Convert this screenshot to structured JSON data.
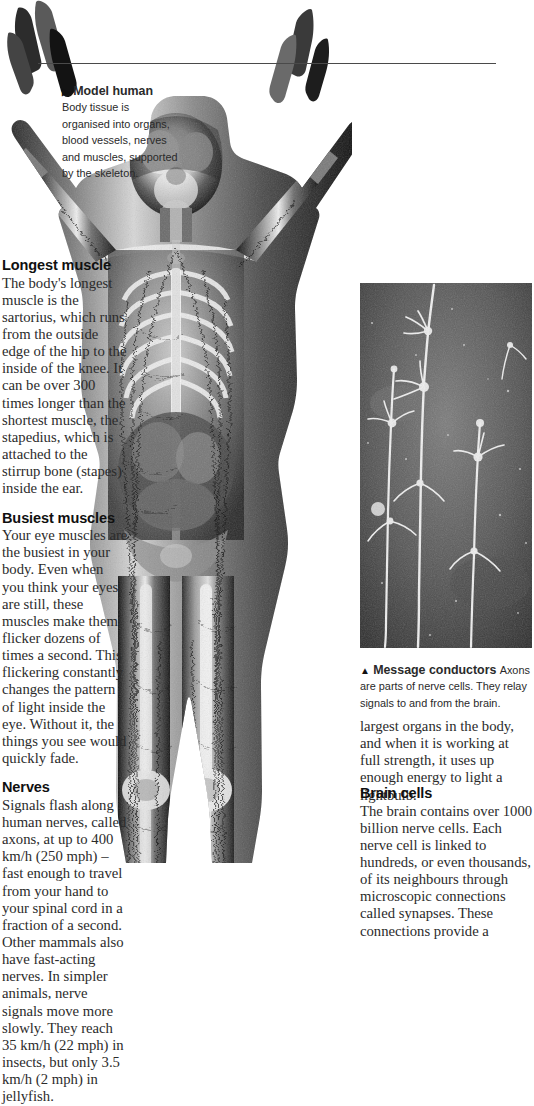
{
  "page": {
    "background_color": "#ffffff",
    "text_color": "#2b2b2b",
    "rule_color": "#4a4a4a"
  },
  "figures": {
    "body_scan": {
      "name": "model-human-body-scan",
      "description": "Full-body anatomical scan showing skeleton, blood vessels, nerves and muscles",
      "caption": {
        "marker": "▶",
        "lead": "Model human",
        "text": "Body tissue is organised into organs, blood vessels, nerves and muscles, supported by the skeleton."
      }
    },
    "neuron": {
      "name": "axon-micrograph",
      "description": "Micrograph of branching axons of nerve cells on dark background",
      "caption": {
        "marker": "▲",
        "lead": "Message conductors",
        "text": "Axons are parts of nerve cells. They relay signals to and from the brain."
      }
    }
  },
  "sections": {
    "longest_muscle": {
      "heading": "Longest muscle",
      "text": "The body's longest muscle is the sartorius, which runs from the outside edge of the hip to the inside of the knee. It can be over 300 times longer than the shortest muscle, the stapedius, which is attached to the stirrup bone (stapes) inside the ear."
    },
    "busiest_muscles": {
      "heading": "Busiest muscles",
      "text": "Your eye muscles are the busiest in your body. Even when you think your eyes are still, these muscles make them flicker dozens of times a second. This flickering constantly changes the pattern of light inside the eye. Without it, the things you see would quickly fade."
    },
    "nerves": {
      "heading": "Nerves",
      "text": "Signals flash along human nerves, called axons, at up to 400 km/h (250 mph) – fast enough to travel from your hand to your spinal cord in a fraction of a second. Other mammals also have fast-acting nerves. In simpler animals, nerve signals move more slowly. They reach 35 km/h (22 mph) in insects, but only 3.5 km/h (2 mph) in jellyfish."
    },
    "brain_continued": {
      "text": "largest organs in the body, and when it is working at full strength, it uses up enough energy to light a lightbulb."
    },
    "brain_cells": {
      "heading": "Brain cells",
      "text": "The brain contains over 1000 billion nerve cells. Each nerve cell is linked to hundreds, or even thousands, of its neighbours through microscopic connections called synapses. These connections provide a"
    }
  }
}
